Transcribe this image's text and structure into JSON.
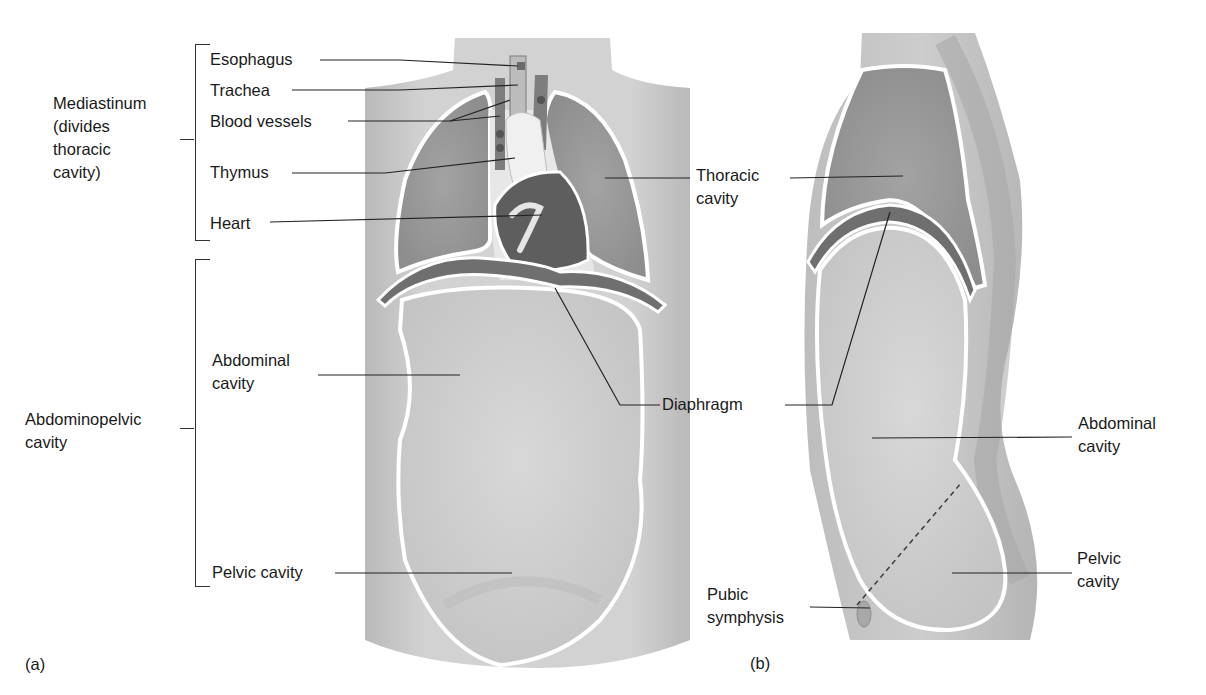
{
  "figure": {
    "panels": [
      {
        "id": "a",
        "caption": "(a)",
        "view": "anterior"
      },
      {
        "id": "b",
        "caption": "(b)",
        "view": "lateral"
      }
    ]
  },
  "panel_a": {
    "groups": {
      "mediastinum": "Mediastinum\n(divides\nthoracic\ncavity)",
      "abdominopelvic": "Abdominopelvic\ncavity"
    },
    "labels": {
      "esophagus": "Esophagus",
      "trachea": "Trachea",
      "blood_vessels": "Blood vessels",
      "thymus": "Thymus",
      "heart": "Heart",
      "abdominal_cavity": "Abdominal\ncavity",
      "pelvic_cavity": "Pelvic cavity",
      "thoracic_cavity": "Thoracic\ncavity"
    }
  },
  "shared": {
    "diaphragm": "Diaphragm"
  },
  "panel_b": {
    "labels": {
      "abdominal_cavity": "Abdominal\ncavity",
      "pelvic_cavity": "Pelvic\ncavity",
      "pubic_symphysis": "Pubic\nsymphysis"
    }
  },
  "colors": {
    "skin": "#c9c9c9",
    "cavity_dark": "#9a9a9a",
    "abdomen": "#d3d3d3",
    "membrane": "#ffffff",
    "diaphragm": "#6e6e6e",
    "heart": "#5c5c5c",
    "leader": "#222222"
  }
}
